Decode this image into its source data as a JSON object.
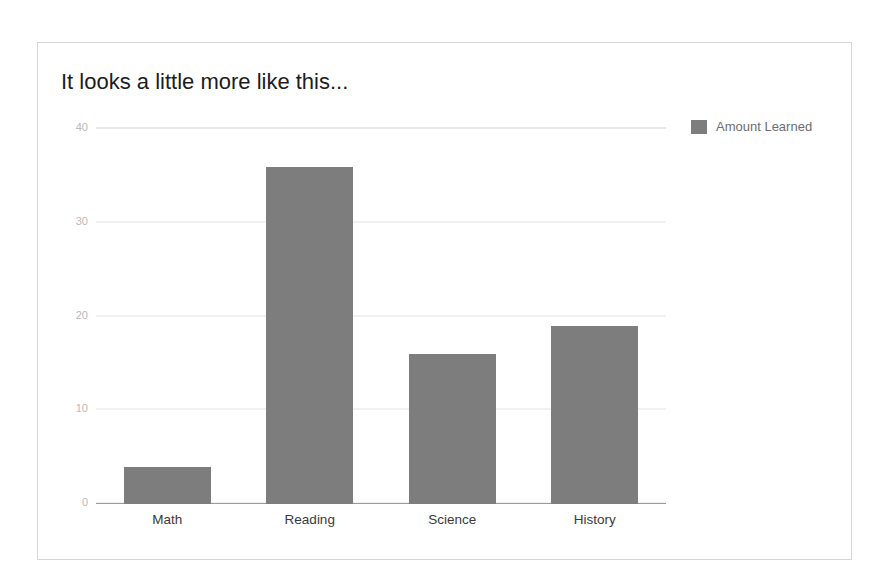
{
  "chart_data": {
    "type": "bar",
    "title": "It looks a little more like this...",
    "categories": [
      "Math",
      "Reading",
      "Science",
      "History"
    ],
    "series": [
      {
        "name": "Amount Learned",
        "values": [
          4,
          36,
          16,
          19
        ],
        "color": "#7d7d7d"
      }
    ],
    "xlabel": "",
    "ylabel": "",
    "ylim": [
      0,
      40
    ],
    "yticks": [
      0,
      10,
      20,
      30,
      40
    ],
    "ytick_labels": [
      "0",
      "10",
      "20",
      "30",
      "40"
    ],
    "grid": true,
    "legend": {
      "position": "top-right",
      "entries": [
        "Amount Learned"
      ]
    }
  },
  "card": {
    "border_color": "#d6d6d6",
    "background": "#ffffff"
  }
}
